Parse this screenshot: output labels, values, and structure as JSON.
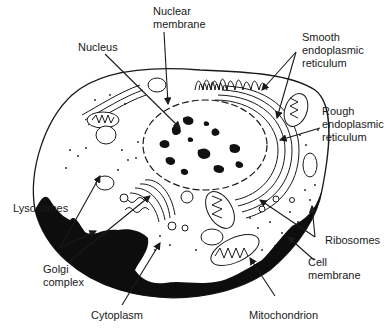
{
  "diagram": {
    "type": "animal-cell-cross-section",
    "labels": {
      "nuclear_membrane": "Nuclear\nmembrane",
      "nucleus": "Nucleus",
      "smooth_er": "Smooth\nendoplasmic\nreticulum",
      "rough_er": "Rough\nendoplasmic\nreticulum",
      "lysosomes": "Lysosomes",
      "ribosomes": "Ribosomes",
      "golgi": "Golgi\ncomplex",
      "cell_membrane": "Cell\nmembrane",
      "cytoplasm": "Cytoplasm",
      "mitochondrion": "Mitochondrion"
    },
    "colors": {
      "ink": "#1a1a1a",
      "background": "#ffffff"
    }
  }
}
